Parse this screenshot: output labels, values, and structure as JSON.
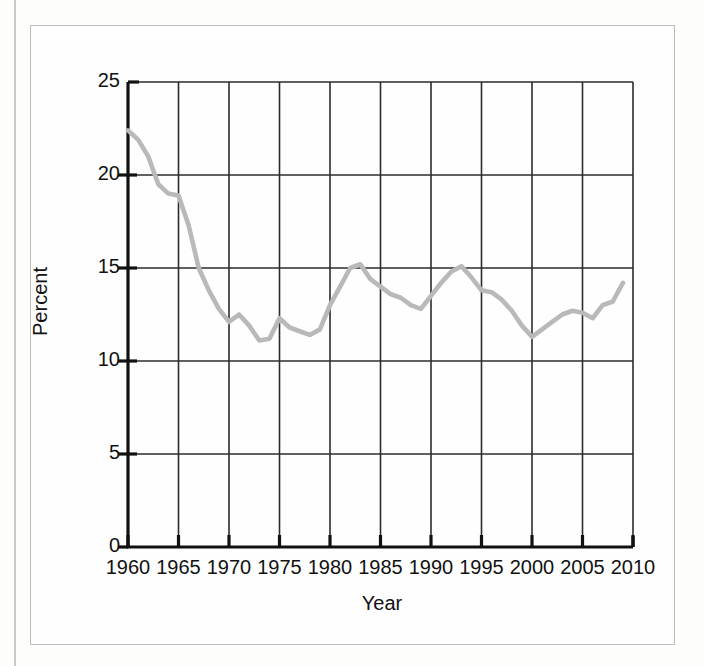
{
  "figure": {
    "ylabel": "Percent",
    "xlabel": "Year"
  },
  "chart_data": {
    "type": "line",
    "title": "",
    "xlabel": "Year",
    "ylabel": "Percent",
    "xlim": [
      1960,
      2010
    ],
    "ylim": [
      0,
      25
    ],
    "xticks": [
      1960,
      1965,
      1970,
      1975,
      1980,
      1985,
      1990,
      1995,
      2000,
      2005,
      2010
    ],
    "yticks": [
      0,
      5,
      10,
      15,
      20,
      25
    ],
    "xtick_labels": [
      "1960",
      "1965",
      "1970",
      "1975",
      "1980",
      "1985",
      "1990",
      "1995",
      "2000",
      "2005",
      "2010"
    ],
    "ytick_labels": [
      "0",
      "5",
      "10",
      "15",
      "20",
      "25"
    ],
    "grid": true,
    "legend": null,
    "line_color": "#b9b9b9",
    "grid_color": "#2b2b2b",
    "axis_color": "#111111",
    "series": [
      {
        "name": "Percent",
        "x": [
          1960,
          1961,
          1962,
          1963,
          1964,
          1965,
          1966,
          1967,
          1968,
          1969,
          1970,
          1971,
          1972,
          1973,
          1974,
          1975,
          1976,
          1977,
          1978,
          1979,
          1980,
          1981,
          1982,
          1983,
          1984,
          1985,
          1986,
          1987,
          1988,
          1989,
          1990,
          1991,
          1992,
          1993,
          1994,
          1995,
          1996,
          1997,
          1998,
          1999,
          2000,
          2001,
          2002,
          2003,
          2004,
          2005,
          2006,
          2007,
          2008,
          2009
        ],
        "values": [
          22.4,
          21.9,
          21.0,
          19.5,
          19.0,
          18.9,
          17.3,
          15.0,
          13.8,
          12.8,
          12.1,
          12.5,
          11.9,
          11.1,
          11.2,
          12.3,
          11.8,
          11.6,
          11.4,
          11.7,
          13.0,
          14.0,
          15.0,
          15.2,
          14.4,
          14.0,
          13.6,
          13.4,
          13.0,
          12.8,
          13.5,
          14.2,
          14.8,
          15.1,
          14.5,
          13.8,
          13.7,
          13.3,
          12.7,
          11.9,
          11.3,
          11.7,
          12.1,
          12.5,
          12.7,
          12.6,
          12.3,
          13.0,
          13.2,
          14.2
        ]
      }
    ]
  }
}
